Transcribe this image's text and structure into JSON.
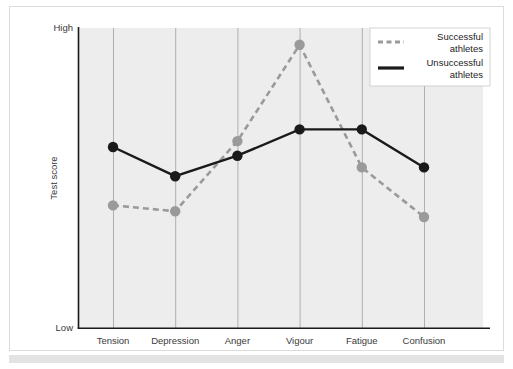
{
  "chart_data": {
    "type": "line",
    "title": "",
    "xlabel": "",
    "ylabel": "Test score",
    "categories": [
      "Tension",
      "Depression",
      "Anger",
      "Vigour",
      "Fatigue",
      "Confusion"
    ],
    "ytick_labels": [
      "High",
      "Low"
    ],
    "ylim": [
      "Low",
      "High"
    ],
    "ylim_numeric": [
      0,
      100
    ],
    "grid": "vertical gridlines at each category",
    "legend_position": "top-right",
    "series": [
      {
        "name": "Successful athletes",
        "style": "dashed",
        "color": "#9a9a9a",
        "marker": "circle",
        "values": [
          42,
          40,
          64,
          97,
          55,
          38
        ]
      },
      {
        "name": "Unsuccessful athletes",
        "style": "solid",
        "color": "#1a1a1a",
        "marker": "circle",
        "values": [
          62,
          52,
          59,
          68,
          68,
          55
        ]
      }
    ]
  },
  "axes": {
    "y_high_label": "High",
    "y_low_label": "Low",
    "y_axis_title": "Test score"
  },
  "legend": {
    "items": [
      {
        "label_line1": "Successful",
        "label_line2": "athletes",
        "swatch": "dashed-line-swatch"
      },
      {
        "label_line1": "Unsuccessful",
        "label_line2": "athletes",
        "swatch": "solid-line-swatch"
      }
    ]
  },
  "colors": {
    "successful": "#9a9a9a",
    "unsuccessful": "#1a1a1a",
    "plot_background": "#ededed",
    "gridline": "#a8a8a8",
    "axis": "#1a1a1a",
    "page_background": "#ffffff",
    "frame_border": "#dcdcdc",
    "bottom_band": "#e3e3e3"
  }
}
